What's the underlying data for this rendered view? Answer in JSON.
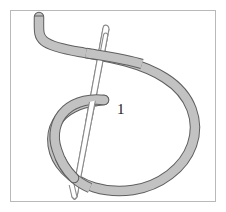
{
  "figure": {
    "canvas": {
      "width": 226,
      "height": 212,
      "background_color": "#ffffff"
    },
    "border": {
      "name": "figure-frame",
      "x": 10,
      "y": 10,
      "width": 206,
      "height": 192,
      "stroke_color": "#b9b9b9",
      "stroke_width": 1,
      "fill_color": "#ffffff"
    },
    "labels": [
      {
        "id": "step-1",
        "text": "1",
        "x": 117,
        "y": 114,
        "font_size": 15,
        "color": "#1a1a1a"
      }
    ],
    "elements": {
      "thread": {
        "name": "thread",
        "fill_color": "#c2c2c2",
        "stroke_color": "#5f5f5f",
        "stroke_width": 1,
        "band_width": 8,
        "parts": [
          {
            "id": "thread-tail-upper-left",
            "description": "Thread tail entering from upper left, hooks down then runs right"
          },
          {
            "id": "thread-main-loop",
            "description": "Large teardrop loop sweeping right and down around the bottom"
          },
          {
            "id": "thread-inner-curve",
            "description": "Short inner curve ending in a rounded tip beside label 1"
          }
        ]
      },
      "needle": {
        "name": "needle",
        "fill_color": "#ffffff",
        "stroke_color": "#7a7a7a",
        "stroke_width": 1,
        "tip_point": {
          "x": 73,
          "y": 197
        },
        "eye_point": {
          "x": 107,
          "y": 27
        },
        "description": "Slim straight needle angled from upper right down to lower left, with an elongated eye near the top"
      }
    },
    "colors": {
      "thread_fill": "#c2c2c2",
      "thread_outline": "#5f5f5f",
      "needle_fill": "#ffffff",
      "needle_outline": "#7a7a7a",
      "frame": "#b9b9b9",
      "label": "#1a1a1a",
      "background": "#ffffff"
    }
  }
}
